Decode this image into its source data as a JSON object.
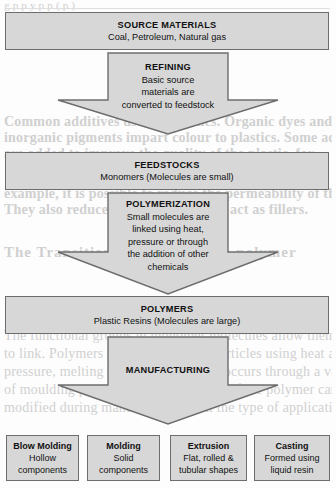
{
  "background": {
    "note": "faint scanned page bleed-through text behind diagram",
    "lines": [
      "g               p                 p              y       p    p     ( p   )",
      "Common additives used in plastics. Organic dyes and",
      "inorganic pigments impart colour to plastics. Some ad-ditives",
      "are added to improve the quality of the plastic, for",
      "example, it is possible to reduce the permeability of the polymer.",
      "They also reduce static charges, and act as fillers.",
      "The Transition of monomers to polymer",
      "The functional groups in monomer molecules allow them",
      "to link. Polymers can be formed into articles using heat and",
      "pressure, melting and moulding. This occurs through a variety",
      "of moulding processes. The properties of the polymer can be",
      "modified during manufacture to suit the type of application."
    ]
  },
  "diagram": {
    "accent_fill": "#d7d7d7",
    "accent_border": "#6d6d6d",
    "stages": [
      {
        "kind": "box",
        "name": "source-materials",
        "title": "SOURCE MATERIALS",
        "sub": "Coal, Petroleum, Natural gas"
      },
      {
        "kind": "arrow",
        "name": "refining",
        "title": "REFINING",
        "lines": [
          "Basic source",
          "materials are",
          "converted to feedstock"
        ]
      },
      {
        "kind": "box",
        "name": "feedstocks",
        "title": "FEEDSTOCKS",
        "sub": "Monomers (Molecules are small)"
      },
      {
        "kind": "arrow",
        "name": "polymerization",
        "title": "POLYMERIZATION",
        "lines": [
          "Small molecules are",
          "linked using heat,",
          "pressure or through",
          "the addition of other",
          "chemicals"
        ]
      },
      {
        "kind": "box",
        "name": "polymers",
        "title": "POLYMERS",
        "sub": "Plastic Resins (Molecules are large)"
      },
      {
        "kind": "arrow",
        "name": "manufacturing",
        "title": "MANUFACTURING",
        "lines": []
      }
    ],
    "processes": [
      {
        "name": "blow-molding",
        "title": "Blow Molding",
        "lines": [
          "Hollow",
          "components"
        ]
      },
      {
        "name": "molding",
        "title": "Molding",
        "lines": [
          "Solid",
          "components"
        ]
      },
      {
        "name": "extrusion",
        "title": "Extrusion",
        "lines": [
          "Flat, rolled &",
          "tubular shapes"
        ]
      },
      {
        "name": "casting",
        "title": "Casting",
        "lines": [
          "Formed using",
          "liquid resin"
        ]
      }
    ]
  }
}
